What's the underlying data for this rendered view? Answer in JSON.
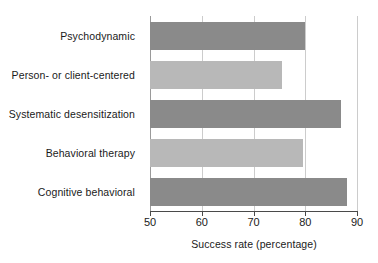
{
  "chart_data": {
    "type": "bar",
    "orientation": "horizontal",
    "title": "",
    "xlabel": "Success rate (percentage)",
    "ylabel": "",
    "xlim": [
      50,
      90
    ],
    "xticks": [
      50,
      60,
      70,
      80,
      90
    ],
    "xticklabels": [
      "50",
      "60",
      "70",
      "80",
      "90"
    ],
    "grid": "vertical",
    "legend": "none",
    "categories": [
      "Psychodynamic",
      "Person- or client-centered",
      "Systematic desensitization",
      "Behavioral therapy",
      "Cognitive behavioral"
    ],
    "values": [
      80,
      75.5,
      87,
      79.5,
      88
    ],
    "bar_colors": [
      "#8a8a8a",
      "#b8b8b8",
      "#8a8a8a",
      "#b8b8b8",
      "#8a8a8a"
    ]
  },
  "style": {
    "background": "#ffffff",
    "gridline_color": "#cccccc",
    "axis_color": "#4a4a4a",
    "text_color": "#1a1a1a",
    "dark_bar": "#8a8a8a",
    "light_bar": "#b8b8b8"
  }
}
